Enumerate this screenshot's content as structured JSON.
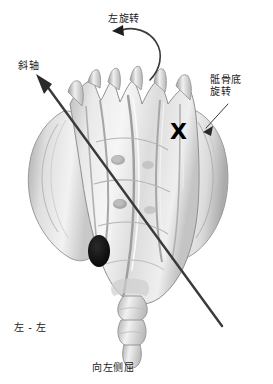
{
  "figure": {
    "caption": "向左侧屈",
    "background_color": "#ffffff"
  },
  "labels": {
    "left_rotation": "左旋转",
    "oblique_axis": "斜轴",
    "sacral_base_rotation_line1": "骶骨底",
    "sacral_base_rotation_line2": "旋转",
    "left_left": "左 - 左",
    "caption": "向左侧屈"
  },
  "markers": {
    "x_marker": "X",
    "x_marker_color": "#000000",
    "foramen_color": "#0d0d0d"
  },
  "colors": {
    "bone_light": "#f4f4f4",
    "bone_mid": "#d6d6d6",
    "bone_dark": "#9a9a9a",
    "bone_shadow": "#7d7d7d",
    "outline": "#8c8c8c",
    "arrow": "#3a3a3a",
    "text": "#1a1a1a"
  },
  "annotations": {
    "oblique_axis_arrow": "diagonal double-ended line from lower-right to upper-left with arrowhead at upper-left",
    "rotation_arrow": "curved arrow arcing counter-clockwise to the left with arrowhead pointing left",
    "sacral_base_leader": "short straight leader arrow pointing down-left toward sacral base"
  }
}
